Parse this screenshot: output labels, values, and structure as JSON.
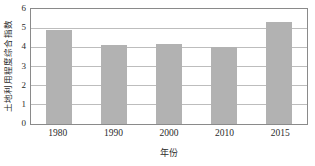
{
  "chart_data": {
    "type": "bar",
    "title": "",
    "subtitle": "",
    "xlabel": "年份",
    "ylabel": "土地利用程度综合指数",
    "categories": [
      "1980",
      "1990",
      "2000",
      "2010",
      "2015"
    ],
    "values": [
      4.9,
      4.1,
      4.2,
      4.0,
      5.3
    ],
    "series": [
      {
        "name": "土地利用程度综合指数",
        "values": [
          4.9,
          4.1,
          4.2,
          4.0,
          5.3
        ]
      }
    ],
    "ylim": [
      0,
      6
    ],
    "yticks": [
      "0",
      "1",
      "2",
      "3",
      "4",
      "5",
      "6"
    ],
    "ytick_values": [
      0,
      1,
      2,
      3,
      4,
      5,
      6
    ],
    "xticks": [
      "1980",
      "1990",
      "2000",
      "2010",
      "2015"
    ],
    "grid": true,
    "grid_axis": "y",
    "legend": false,
    "legend_position": "none",
    "annotations": [],
    "bar_color": "#b2b2b2",
    "gridline_color": "#bdbdbd",
    "axis_color": "#8a8a8a",
    "background_color": "#ffffff",
    "text_color": "#2b2b2b"
  }
}
